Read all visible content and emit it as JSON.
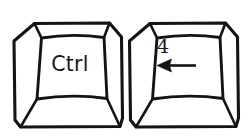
{
  "illustration": {
    "title": "Keyboard shortcut keys",
    "description": "Two illustrated keyboard keycaps shown side by side",
    "background_color": "#ffffff",
    "line_color": "#141414",
    "text_color": "#171717"
  },
  "keys": [
    {
      "id": "ctrl-key",
      "name": "Ctrl key",
      "legend": "Ctrl",
      "legend_position": "center",
      "secondary_legend": "",
      "glyph": ""
    },
    {
      "id": "numpad-4-key",
      "name": "Numeric keypad 4 key",
      "legend": "4",
      "legend_position": "top-left",
      "secondary_legend": "",
      "glyph": "left-arrow"
    }
  ],
  "shortcut": {
    "combination": "Ctrl + 4",
    "separator": "+"
  }
}
